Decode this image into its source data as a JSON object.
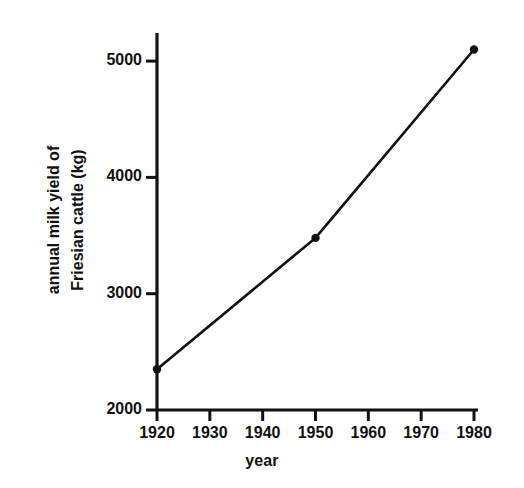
{
  "chart_data": {
    "type": "line",
    "title": "",
    "xlabel": "year",
    "ylabel": "annual milk yield of Friesian cattle (kg)",
    "ylabel_lines": [
      "annual milk yield of",
      "Friesian cattle (kg)"
    ],
    "x": [
      1920,
      1950,
      1980
    ],
    "values": [
      2350,
      3480,
      5100
    ],
    "series": [
      {
        "name": "annual milk yield of Friesian cattle",
        "x": [
          1920,
          1950,
          1980
        ],
        "values": [
          2350,
          3480,
          5100
        ]
      }
    ],
    "xlim": [
      1920,
      1980
    ],
    "ylim": [
      2000,
      5100
    ],
    "xticks": [
      1920,
      1930,
      1940,
      1950,
      1960,
      1970,
      1980
    ],
    "xtick_labels": [
      "1920",
      "1930",
      "1940",
      "1950",
      "1960",
      "1970",
      "1980"
    ],
    "yticks": [
      2000,
      3000,
      4000,
      5000
    ],
    "ytick_labels": [
      "2000",
      "3000",
      "4000",
      "5000"
    ],
    "y_axis_top_value": 5250,
    "grid": false,
    "legend": false,
    "marker": "filled-circle",
    "line_color": "#111111",
    "marker_color": "#111111",
    "background_color": "#ffffff"
  }
}
